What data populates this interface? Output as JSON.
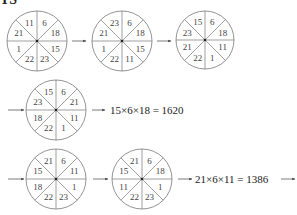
{
  "header_partial": "TS",
  "colors": {
    "line": "#777777",
    "text": "#333333",
    "background": "#ffffff"
  },
  "sector_order": [
    "top-right",
    "right-upper",
    "right-lower",
    "bottom-right",
    "bottom-left",
    "left-lower",
    "left-upper",
    "top-left"
  ],
  "wheels": [
    {
      "id": 1,
      "cx": 37,
      "cy": 41,
      "r": 30,
      "values": [
        "6",
        "18",
        "15",
        "23",
        "22",
        "1",
        "21",
        "11"
      ]
    },
    {
      "id": 2,
      "cx": 122,
      "cy": 41,
      "r": 30,
      "values": [
        "6",
        "18",
        "15",
        "11",
        "22",
        "1",
        "21",
        "23"
      ]
    },
    {
      "id": 3,
      "cx": 205,
      "cy": 40,
      "r": 29,
      "values": [
        "6",
        "18",
        "11",
        "1",
        "22",
        "21",
        "23",
        "15"
      ]
    },
    {
      "id": 4,
      "cx": 56,
      "cy": 110,
      "r": 30,
      "values": [
        "6",
        "21",
        "11",
        "1",
        "22",
        "18",
        "23",
        "15"
      ]
    },
    {
      "id": 5,
      "cx": 56,
      "cy": 179,
      "r": 30,
      "values": [
        "6",
        "11",
        "1",
        "23",
        "22",
        "18",
        "15",
        "21"
      ]
    },
    {
      "id": 6,
      "cx": 142,
      "cy": 179,
      "r": 30,
      "values": [
        "6",
        "18",
        "1",
        "23",
        "22",
        "11",
        "15",
        "21"
      ]
    }
  ],
  "arrows": [
    {
      "x1": 72,
      "y1": 41,
      "x2": 86,
      "y2": 41
    },
    {
      "x1": 157,
      "y1": 41,
      "x2": 171,
      "y2": 41
    },
    {
      "x1": 8,
      "y1": 110,
      "x2": 24,
      "y2": 110
    },
    {
      "x1": 92,
      "y1": 110,
      "x2": 105,
      "y2": 110
    },
    {
      "x1": 8,
      "y1": 179,
      "x2": 24,
      "y2": 179
    },
    {
      "x1": 93,
      "y1": 179,
      "x2": 108,
      "y2": 179
    },
    {
      "x1": 178,
      "y1": 179,
      "x2": 192,
      "y2": 179
    },
    {
      "x1": 281,
      "y1": 179,
      "x2": 295,
      "y2": 179
    }
  ],
  "equations": [
    {
      "text": "15×6×18 = 1620",
      "x": 110,
      "y": 114
    },
    {
      "text": "21×6×11 = 1386",
      "x": 195,
      "y": 183
    }
  ]
}
